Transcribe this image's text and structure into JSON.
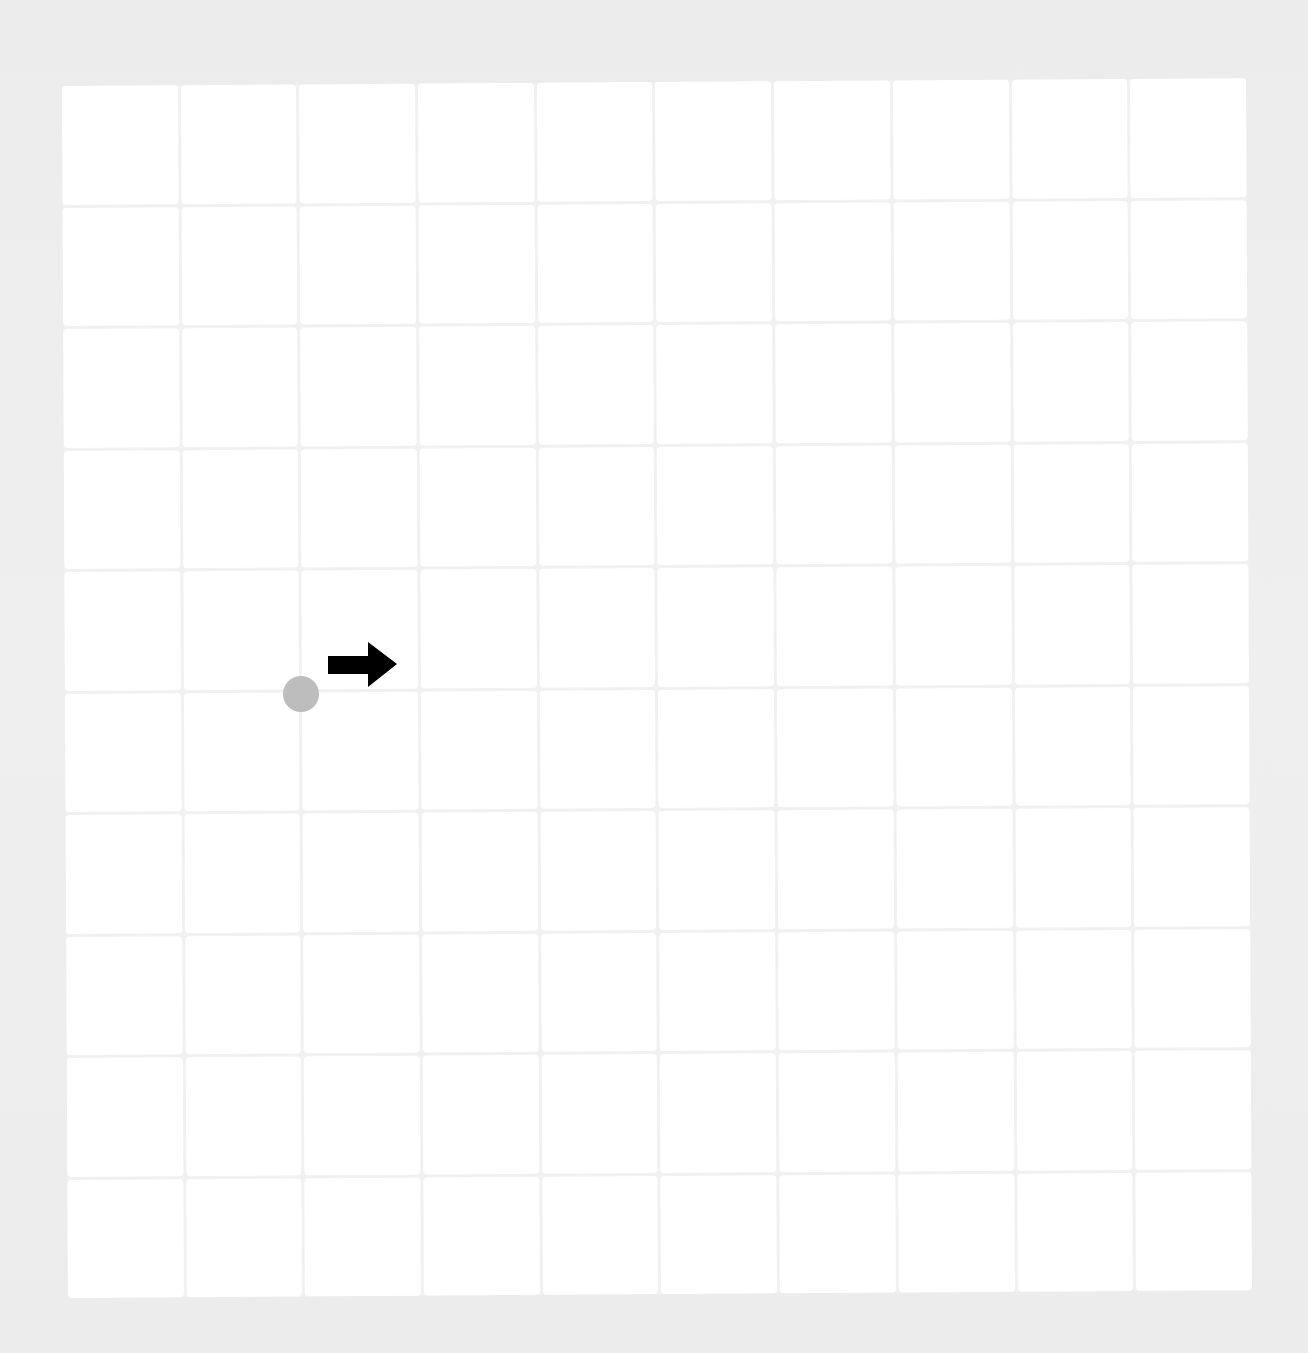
{
  "board": {
    "rows": 10,
    "cols": 10,
    "cell_color": "#ffffff",
    "gridline_color": "#f1f1f1",
    "background_color": "#ededed"
  },
  "player": {
    "shape": "circle",
    "color": "#bdbdbd",
    "center_x": 301,
    "center_y": 694,
    "radius": 18,
    "grid_intersection": {
      "row": 5,
      "col": 2
    }
  },
  "direction_arrow": {
    "icon": "arrow-right-icon",
    "direction": "right",
    "color": "#000000"
  }
}
